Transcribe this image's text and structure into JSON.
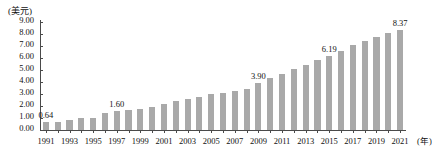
{
  "chart_data": {
    "type": "bar",
    "title": "",
    "subtitle": "",
    "unit_label": "(美元)",
    "xlabel": "(年)",
    "ylabel": "",
    "grid": false,
    "legend": "none",
    "ylim": [
      0.0,
      9.0
    ],
    "ytick_labels": [
      "9.00",
      "8.00",
      "7.00",
      "6.00",
      "5.00",
      "4.00",
      "3.00",
      "2.00",
      "1.00",
      "0.00"
    ],
    "ytick_values": [
      9.0,
      8.0,
      7.0,
      6.0,
      5.0,
      4.0,
      3.0,
      2.0,
      1.0,
      0.0
    ],
    "xtick_labels": [
      "1991",
      "1993",
      "1995",
      "1997",
      "1999",
      "2001",
      "2003",
      "2005",
      "2007",
      "2009",
      "2011",
      "2013",
      "2015",
      "2017",
      "2019",
      "2021"
    ],
    "categories": [
      "1991",
      "1992",
      "1993",
      "1994",
      "1995",
      "1996",
      "1997",
      "1998",
      "1999",
      "2000",
      "2001",
      "2002",
      "2003",
      "2004",
      "2005",
      "2006",
      "2007",
      "2008",
      "2009",
      "2010",
      "2011",
      "2012",
      "2013",
      "2014",
      "2015",
      "2016",
      "2017",
      "2018",
      "2019",
      "2020",
      "2021"
    ],
    "values": [
      0.64,
      0.7,
      0.85,
      0.98,
      1.0,
      1.38,
      1.6,
      1.68,
      1.78,
      1.95,
      2.18,
      2.38,
      2.58,
      2.78,
      3.02,
      3.1,
      3.22,
      3.4,
      3.9,
      4.35,
      4.7,
      5.1,
      5.45,
      5.8,
      6.19,
      6.55,
      7.05,
      7.4,
      7.75,
      8.05,
      8.37
    ],
    "point_labels": [
      {
        "category": "1991",
        "value": 0.64,
        "text": "0.64"
      },
      {
        "category": "1997",
        "value": 1.6,
        "text": "1.60"
      },
      {
        "category": "2009",
        "value": 3.9,
        "text": "3.90"
      },
      {
        "category": "2015",
        "value": 6.19,
        "text": "6.19"
      },
      {
        "category": "2021",
        "value": 8.37,
        "text": "8.37"
      }
    ],
    "bar_color": "#a9a9a9",
    "axis_color": "#4a4a4a",
    "text_color": "#111111"
  }
}
